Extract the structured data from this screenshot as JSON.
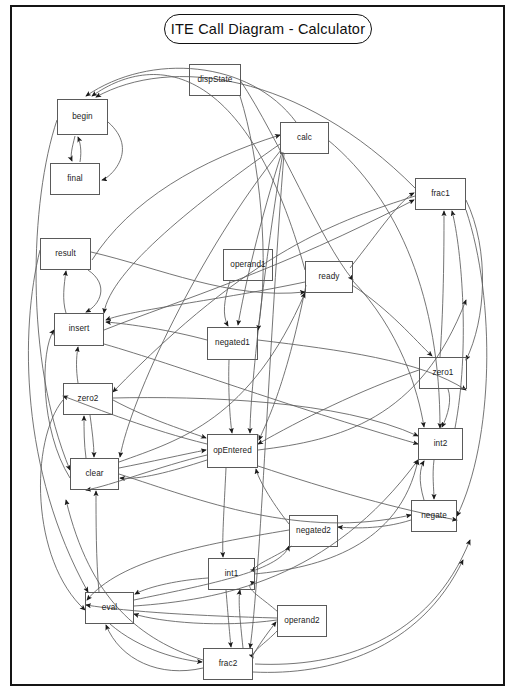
{
  "diagram": {
    "title": "ITE Call Diagram - Calculator",
    "type": "call-graph",
    "frame": {
      "border_color": "#151515",
      "background": "#ffffff"
    },
    "edge_color": "#555555",
    "node_border_color": "#5a5a5a",
    "nodes": [
      {
        "id": "dispState",
        "label": "dispState",
        "x": 189,
        "y": 64,
        "w": 52,
        "h": 32
      },
      {
        "id": "begin",
        "label": "begin",
        "x": 57,
        "y": 99,
        "w": 51,
        "h": 36
      },
      {
        "id": "calc",
        "label": "calc",
        "x": 280,
        "y": 122,
        "w": 49,
        "h": 32
      },
      {
        "id": "final",
        "label": "final",
        "x": 50,
        "y": 163,
        "w": 50,
        "h": 32
      },
      {
        "id": "frac1",
        "label": "frac1",
        "x": 415,
        "y": 178,
        "w": 51,
        "h": 32
      },
      {
        "id": "result",
        "label": "result",
        "x": 40,
        "y": 238,
        "w": 51,
        "h": 32
      },
      {
        "id": "operand1",
        "label": "operand1",
        "x": 223,
        "y": 249,
        "w": 50,
        "h": 32
      },
      {
        "id": "ready",
        "label": "ready",
        "x": 305,
        "y": 261,
        "w": 48,
        "h": 32
      },
      {
        "id": "insert",
        "label": "insert",
        "x": 54,
        "y": 313,
        "w": 50,
        "h": 33
      },
      {
        "id": "negated1",
        "label": "negated1",
        "x": 207,
        "y": 327,
        "w": 51,
        "h": 33
      },
      {
        "id": "zero1",
        "label": "zero1",
        "x": 419,
        "y": 357,
        "w": 48,
        "h": 32
      },
      {
        "id": "zero2",
        "label": "zero2",
        "x": 63,
        "y": 383,
        "w": 50,
        "h": 32
      },
      {
        "id": "opEntered",
        "label": "opEntered",
        "x": 207,
        "y": 434,
        "w": 51,
        "h": 34
      },
      {
        "id": "int2",
        "label": "int2",
        "x": 418,
        "y": 428,
        "w": 45,
        "h": 32
      },
      {
        "id": "clear",
        "label": "clear",
        "x": 70,
        "y": 458,
        "w": 49,
        "h": 32
      },
      {
        "id": "negate",
        "label": "negate",
        "x": 411,
        "y": 500,
        "w": 46,
        "h": 32
      },
      {
        "id": "negated2",
        "label": "negated2",
        "x": 289,
        "y": 515,
        "w": 49,
        "h": 32
      },
      {
        "id": "int1",
        "label": "int1",
        "x": 208,
        "y": 558,
        "w": 47,
        "h": 32
      },
      {
        "id": "eval",
        "label": "eval",
        "x": 85,
        "y": 592,
        "w": 49,
        "h": 32
      },
      {
        "id": "operand2",
        "label": "operand2",
        "x": 277,
        "y": 605,
        "w": 50,
        "h": 32
      },
      {
        "id": "frac2",
        "label": "frac2",
        "x": 203,
        "y": 648,
        "w": 50,
        "h": 32
      }
    ],
    "edges": [
      {
        "from": "calc",
        "to": "begin"
      },
      {
        "from": "ready",
        "to": "begin"
      },
      {
        "from": "frac1",
        "to": "begin"
      },
      {
        "from": "begin",
        "to": "final"
      },
      {
        "from": "calc",
        "to": "final"
      },
      {
        "from": "final",
        "to": "begin"
      },
      {
        "from": "calc",
        "to": "negated1"
      },
      {
        "from": "calc",
        "to": "clear"
      },
      {
        "from": "calc",
        "to": "insert"
      },
      {
        "from": "calc",
        "to": "opEntered"
      },
      {
        "from": "calc",
        "to": "frac2"
      },
      {
        "from": "operand1",
        "to": "negated1"
      },
      {
        "from": "ready",
        "to": "frac1"
      },
      {
        "from": "ready",
        "to": "zero1"
      },
      {
        "from": "ready",
        "to": "insert"
      },
      {
        "from": "ready",
        "to": "opEntered"
      },
      {
        "from": "ready",
        "to": "int2"
      },
      {
        "from": "zero1",
        "to": "frac1"
      },
      {
        "from": "zero1",
        "to": "int2"
      },
      {
        "from": "int2",
        "to": "frac1"
      },
      {
        "from": "int2",
        "to": "negate"
      },
      {
        "from": "negate",
        "to": "int2"
      },
      {
        "from": "negate",
        "to": "negated2"
      },
      {
        "from": "negated2",
        "to": "opEntered"
      },
      {
        "from": "negated2",
        "to": "int1"
      },
      {
        "from": "negated1",
        "to": "insert"
      },
      {
        "from": "negated1",
        "to": "opEntered"
      },
      {
        "from": "insert",
        "to": "result"
      },
      {
        "from": "result",
        "to": "insert"
      },
      {
        "from": "zero2",
        "to": "insert"
      },
      {
        "from": "zero2",
        "to": "clear"
      },
      {
        "from": "clear",
        "to": "zero2"
      },
      {
        "from": "clear",
        "to": "opEntered"
      },
      {
        "from": "opEntered",
        "to": "clear"
      },
      {
        "from": "opEntered",
        "to": "negated2"
      },
      {
        "from": "opEntered",
        "to": "int1"
      },
      {
        "from": "int1",
        "to": "frac2"
      },
      {
        "from": "int1",
        "to": "eval"
      },
      {
        "from": "eval",
        "to": "clear"
      },
      {
        "from": "eval",
        "to": "frac2"
      },
      {
        "from": "operand2",
        "to": "frac2"
      },
      {
        "from": "operand2",
        "to": "int1"
      },
      {
        "from": "operand2",
        "to": "eval"
      },
      {
        "from": "frac2",
        "to": "operand2"
      },
      {
        "from": "frac2",
        "to": "eval"
      },
      {
        "from": "frac1",
        "to": "zero1"
      },
      {
        "from": "frac2",
        "to": "int1"
      }
    ]
  }
}
